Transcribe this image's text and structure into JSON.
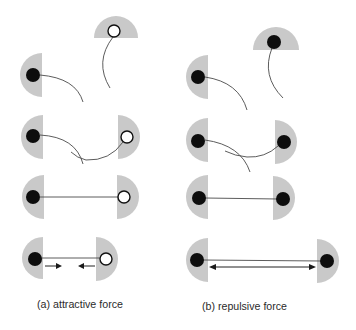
{
  "figure": {
    "panels": [
      {
        "id": "a",
        "caption": "(a) attractive force",
        "force_type": "attractive",
        "left_particle": "filled",
        "right_particle": "hollow",
        "stages": [
          "separate",
          "entangled",
          "connected",
          "pulling-together"
        ]
      },
      {
        "id": "b",
        "caption": "(b) repulsive force",
        "force_type": "repulsive",
        "left_particle": "filled",
        "right_particle": "filled",
        "stages": [
          "separate",
          "entangled",
          "connected",
          "pushing-apart"
        ]
      }
    ]
  },
  "colors": {
    "half_disc": "#c9c9c9",
    "filled_particle": "#0d0d0d",
    "hollow_particle_fill": "#ffffff",
    "tether": "#4a4a4a",
    "arrow": "#1a1a1a",
    "caption": "#2b2b2b"
  }
}
